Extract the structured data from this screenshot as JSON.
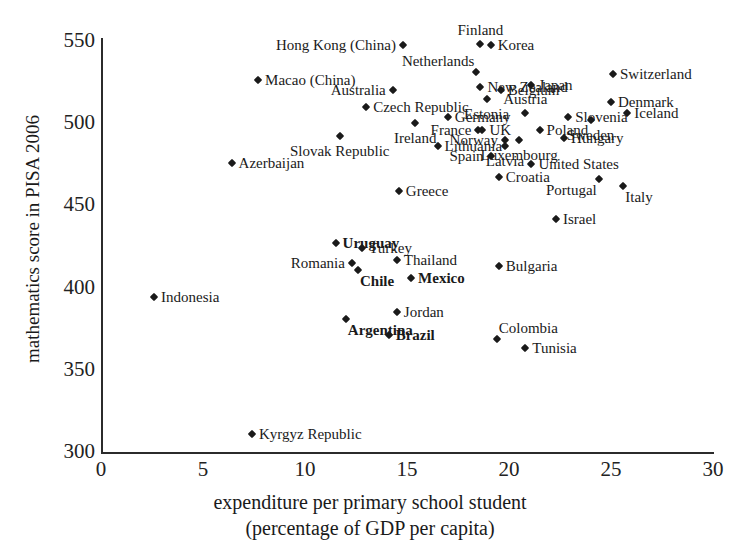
{
  "chart_data": {
    "type": "scatter",
    "title": "",
    "xlabel": "expenditure per primary school student",
    "xlabel_line2": "(percentage of GDP per capita)",
    "ylabel": "mathematics score in PISA 2006",
    "xlim": [
      0,
      30
    ],
    "ylim": [
      300,
      550
    ],
    "xticks": [
      "0",
      "5",
      "10",
      "15",
      "20",
      "25",
      "30"
    ],
    "yticks": [
      "550",
      "500",
      "450",
      "400",
      "350",
      "300"
    ],
    "grid": false,
    "legend": "none",
    "marker_color": "#1a1a1a",
    "marker_shape": "diamond",
    "points": [
      {
        "label": "Hong Kong (China)",
        "x": 14.8,
        "y": 547.5,
        "bold": false,
        "pos": "left"
      },
      {
        "label": "Finland",
        "x": 18.6,
        "y": 548.4,
        "bold": false,
        "pos": "above"
      },
      {
        "label": "Korea",
        "x": 19.1,
        "y": 547.5,
        "bold": false,
        "pos": "right"
      },
      {
        "label": "Switzerland",
        "x": 25.1,
        "y": 530.0,
        "bold": false,
        "pos": "right"
      },
      {
        "label": "Netherlands",
        "x": 18.4,
        "y": 531.0,
        "bold": false,
        "pos": "aboveleft"
      },
      {
        "label": "New Zealand",
        "x": 18.6,
        "y": 522.0,
        "bold": false,
        "pos": "right"
      },
      {
        "label": "Macao (China)",
        "x": 7.7,
        "y": 526.0,
        "bold": false,
        "pos": "right"
      },
      {
        "label": "Japan",
        "x": 21.1,
        "y": 523.0,
        "bold": false,
        "pos": "right"
      },
      {
        "label": "Australia",
        "x": 14.3,
        "y": 520.0,
        "bold": false,
        "pos": "left"
      },
      {
        "label": "Belgium",
        "x": 19.6,
        "y": 520.0,
        "bold": false,
        "pos": "right"
      },
      {
        "label": "Czech Republic",
        "x": 13.0,
        "y": 510.0,
        "bold": false,
        "pos": "right"
      },
      {
        "label": "Estonia",
        "x": 18.9,
        "y": 515.0,
        "bold": false,
        "pos": "below"
      },
      {
        "label": "Austria",
        "x": 20.8,
        "y": 506.0,
        "bold": false,
        "pos": "above"
      },
      {
        "label": "Denmark",
        "x": 25.0,
        "y": 513.0,
        "bold": false,
        "pos": "right"
      },
      {
        "label": "Germany",
        "x": 17.0,
        "y": 504.0,
        "bold": false,
        "pos": "right"
      },
      {
        "label": "Slovenia",
        "x": 22.9,
        "y": 504.0,
        "bold": false,
        "pos": "right"
      },
      {
        "label": "Iceland",
        "x": 25.8,
        "y": 506.0,
        "bold": false,
        "pos": "right"
      },
      {
        "label": "Ireland",
        "x": 15.4,
        "y": 500.0,
        "bold": false,
        "pos": "below"
      },
      {
        "label": "France",
        "x": 18.5,
        "y": 496.0,
        "bold": false,
        "pos": "left"
      },
      {
        "label": "UK",
        "x": 18.7,
        "y": 496.0,
        "bold": false,
        "pos": "right"
      },
      {
        "label": "Norway",
        "x": 19.8,
        "y": 490.0,
        "bold": false,
        "pos": "left"
      },
      {
        "label": "Poland",
        "x": 21.5,
        "y": 496.0,
        "bold": false,
        "pos": "right"
      },
      {
        "label": "Sweden",
        "x": 24.0,
        "y": 502.0,
        "bold": false,
        "pos": "below"
      },
      {
        "label": "Slovak Republic",
        "x": 11.7,
        "y": 492.0,
        "bold": false,
        "pos": "below"
      },
      {
        "label": "Lithuania",
        "x": 16.5,
        "y": 486.0,
        "bold": false,
        "pos": "right"
      },
      {
        "label": "Hungary",
        "x": 22.7,
        "y": 491.0,
        "bold": false,
        "pos": "right"
      },
      {
        "label": "Luxembourg",
        "x": 20.5,
        "y": 490.0,
        "bold": false,
        "pos": "below"
      },
      {
        "label": "Latvia",
        "x": 19.8,
        "y": 486.0,
        "bold": false,
        "pos": "below"
      },
      {
        "label": "Spain",
        "x": 19.1,
        "y": 480.0,
        "bold": false,
        "pos": "left"
      },
      {
        "label": "Azerbaijan",
        "x": 6.4,
        "y": 476.0,
        "bold": false,
        "pos": "right"
      },
      {
        "label": "United States",
        "x": 21.1,
        "y": 475.0,
        "bold": false,
        "pos": "right"
      },
      {
        "label": "Croatia",
        "x": 19.5,
        "y": 467.0,
        "bold": false,
        "pos": "right"
      },
      {
        "label": "Portugal",
        "x": 24.4,
        "y": 466.0,
        "bold": false,
        "pos": "belowleft"
      },
      {
        "label": "Italy",
        "x": 25.6,
        "y": 462.0,
        "bold": false,
        "pos": "belowright"
      },
      {
        "label": "Greece",
        "x": 14.6,
        "y": 459.0,
        "bold": false,
        "pos": "right"
      },
      {
        "label": "Israel",
        "x": 22.3,
        "y": 442.0,
        "bold": false,
        "pos": "right"
      },
      {
        "label": "Uruguay",
        "x": 11.5,
        "y": 427.0,
        "bold": true,
        "pos": "right"
      },
      {
        "label": "Turkey",
        "x": 12.8,
        "y": 424.0,
        "bold": false,
        "pos": "right"
      },
      {
        "label": "Thailand",
        "x": 14.5,
        "y": 417.0,
        "bold": false,
        "pos": "right"
      },
      {
        "label": "Romania",
        "x": 12.3,
        "y": 415.0,
        "bold": false,
        "pos": "left"
      },
      {
        "label": "Chile",
        "x": 12.6,
        "y": 411.0,
        "bold": true,
        "pos": "belowright"
      },
      {
        "label": "Mexico",
        "x": 15.2,
        "y": 406.0,
        "bold": true,
        "pos": "right"
      },
      {
        "label": "Bulgaria",
        "x": 19.5,
        "y": 413.0,
        "bold": false,
        "pos": "right"
      },
      {
        "label": "Indonesia",
        "x": 2.6,
        "y": 394.0,
        "bold": false,
        "pos": "right"
      },
      {
        "label": "Jordan",
        "x": 14.5,
        "y": 385.0,
        "bold": false,
        "pos": "right"
      },
      {
        "label": "Argentina",
        "x": 12.0,
        "y": 381.0,
        "bold": true,
        "pos": "belowright"
      },
      {
        "label": "Brazil",
        "x": 14.1,
        "y": 371.0,
        "bold": true,
        "pos": "right"
      },
      {
        "label": "Colombia",
        "x": 19.4,
        "y": 369.0,
        "bold": false,
        "pos": "aboveright"
      },
      {
        "label": "Tunisia",
        "x": 20.8,
        "y": 363.0,
        "bold": false,
        "pos": "right"
      },
      {
        "label": "Kyrgyz Republic",
        "x": 7.4,
        "y": 311.0,
        "bold": false,
        "pos": "right"
      }
    ]
  }
}
